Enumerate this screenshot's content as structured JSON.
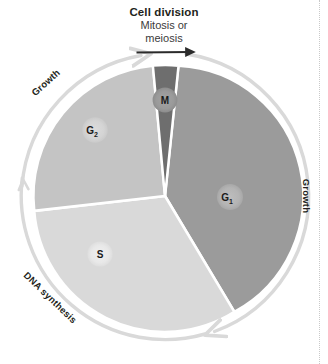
{
  "figure": {
    "kind": "cell-cycle-diagram",
    "title_main": "Cell division",
    "title_sub_line1": "Mitosis or",
    "title_sub_line2": "meiosis"
  },
  "phases": [
    {
      "key": "M",
      "label": "M",
      "subscript": "",
      "name": "mitotic-phase",
      "color": "#6e6e6e",
      "badge_color": "#9a9a9a"
    },
    {
      "key": "G1",
      "label": "G",
      "subscript": "1",
      "name": "gap-1-phase",
      "color": "#9b9b9b",
      "badge_color": "#b4b4b4"
    },
    {
      "key": "S",
      "label": "S",
      "subscript": "",
      "name": "synthesis-phase",
      "color": "#d9d9d9",
      "badge_color": "#eaeaea"
    },
    {
      "key": "G2",
      "label": "G",
      "subscript": "2",
      "name": "gap-2-phase",
      "color": "#c4c4c4",
      "badge_color": "#d6d6d6"
    }
  ],
  "arc_labels": {
    "growth_right": "Growth",
    "growth_left": "Growth",
    "dna_synthesis": "DNA synthesis"
  },
  "colors": {
    "arc_light": "#e2e2e2",
    "arc_dark": "#2b2b2b",
    "gap": "#ffffff",
    "text": "#231f20"
  }
}
